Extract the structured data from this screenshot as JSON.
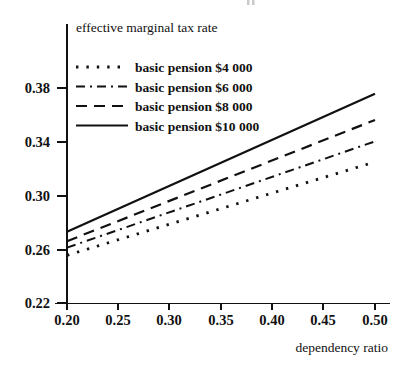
{
  "chart_data": {
    "type": "line",
    "title": "",
    "ylabel": "effective marginal tax rate",
    "xlabel": "dependency ratio",
    "xlim": [
      0.2,
      0.5
    ],
    "ylim": [
      0.22,
      0.4
    ],
    "xticks": [
      "0.20",
      "0.25",
      "0.30",
      "0.35",
      "0.40",
      "0.45",
      "0.50"
    ],
    "xtick_values": [
      0.2,
      0.25,
      0.3,
      0.35,
      0.4,
      0.45,
      0.5
    ],
    "yticks": [
      "0.22",
      "0.26",
      "0.30",
      "0.34",
      "0.38"
    ],
    "ytick_values": [
      0.22,
      0.26,
      0.3,
      0.34,
      0.38
    ],
    "grid": false,
    "legend_position": "upper-left-inside",
    "x": [
      0.2,
      0.5
    ],
    "series": [
      {
        "name": "basic pension $4 000",
        "style": "dotted",
        "values": [
          0.2555,
          0.325
        ]
      },
      {
        "name": "basic pension $6 000",
        "style": "dash-dot",
        "values": [
          0.2612,
          0.3403
        ]
      },
      {
        "name": "basic pension $8 000",
        "style": "dashed",
        "values": [
          0.266,
          0.3562
        ]
      },
      {
        "name": "basic pension $10 000",
        "style": "solid",
        "values": [
          0.273,
          0.3757
        ]
      }
    ]
  },
  "axes": {
    "ylabel": "effective marginal tax rate",
    "xlabel": "dependency ratio",
    "ytick_labels": [
      "0.38",
      "0.34",
      "0.30",
      "0.26",
      "0.22"
    ],
    "xtick_labels": [
      "0.20",
      "0.25",
      "0.30",
      "0.35",
      "0.40",
      "0.45",
      "0.50"
    ]
  },
  "legend": {
    "entries": [
      {
        "label": "basic pension $4 000",
        "style": "dotted"
      },
      {
        "label": "basic pension $6 000",
        "style": "dash-dot"
      },
      {
        "label": "basic pension $8 000",
        "style": "dashed"
      },
      {
        "label": "basic pension $10 000",
        "style": "solid"
      }
    ]
  },
  "colors": {
    "ink": "#111111",
    "background": "#ffffff",
    "artifact": "#c9c9c9"
  }
}
